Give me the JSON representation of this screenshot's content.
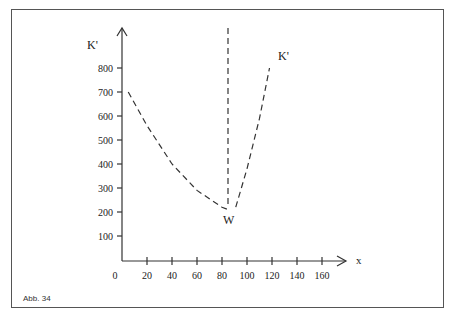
{
  "figure": {
    "caption": "Abb. 34",
    "y_axis_label": "K'",
    "x_axis_label": "x",
    "curve_label": "K'",
    "point_label": "W"
  },
  "chart_data": {
    "type": "line",
    "title": "",
    "xlabel": "x",
    "ylabel": "K'",
    "xlim": [
      0,
      170
    ],
    "ylim": [
      0,
      900
    ],
    "x_ticks": [
      0,
      20,
      40,
      60,
      80,
      100,
      120,
      140,
      160
    ],
    "y_ticks": [
      100,
      200,
      300,
      400,
      500,
      600,
      700,
      800
    ],
    "grid": false,
    "legend": null,
    "series": [
      {
        "name": "K' (left branch)",
        "style": "dashed",
        "x": [
          5,
          20,
          40,
          60,
          80,
          85
        ],
        "y": [
          700,
          560,
          400,
          290,
          220,
          210
        ]
      },
      {
        "name": "K' (right branch)",
        "style": "dashed",
        "x": [
          91,
          100,
          110,
          118
        ],
        "y": [
          220,
          380,
          590,
          800
        ]
      }
    ],
    "annotations": [
      {
        "text": "W",
        "x": 85,
        "y": 210,
        "note": "minimum point"
      },
      {
        "text": "K'",
        "x": 125,
        "y": 830,
        "note": "curve label"
      },
      {
        "type": "vertical-dashed-line",
        "x": 85
      }
    ]
  }
}
